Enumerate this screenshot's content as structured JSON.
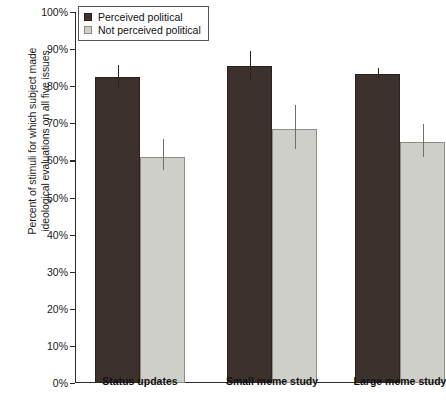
{
  "chart_data": {
    "type": "bar",
    "title": "",
    "xlabel": "",
    "ylabel": "Percent of stimuli for which subject made ideological evaluations on all five issues",
    "ylabel_lines": [
      "Percent of stimuli for which subject made",
      "ideological evaluations on all five issues"
    ],
    "categories": [
      "Status updates",
      "Small meme study",
      "Large meme study"
    ],
    "ylim": [
      0,
      100
    ],
    "ytick_labels": [
      "0%",
      "10%",
      "20%",
      "30%",
      "40%",
      "50%",
      "60%",
      "70%",
      "80%",
      "90%",
      "100%"
    ],
    "ytick_values": [
      0,
      10,
      20,
      30,
      40,
      50,
      60,
      70,
      80,
      90,
      100
    ],
    "grid": false,
    "legend_position": "top-left",
    "series": [
      {
        "name": "Perceived political",
        "color": "#3d312d",
        "values": [
          82.4,
          85.4,
          83.2
        ],
        "error_upper": [
          85.7,
          89.5,
          85.0
        ],
        "error_lower": [
          79.5,
          81.5,
          81.3
        ]
      },
      {
        "name": "Not perceived political",
        "color": "#cfcfc9",
        "values": [
          60.8,
          68.6,
          64.9
        ],
        "error_upper": [
          65.7,
          75.0,
          69.7
        ],
        "error_lower": [
          57.5,
          63.0,
          61.0
        ]
      }
    ]
  },
  "legend": {
    "items": [
      {
        "label": "Perceived political",
        "swatch": "dark"
      },
      {
        "label": "Not perceived political",
        "swatch": "light"
      }
    ]
  }
}
